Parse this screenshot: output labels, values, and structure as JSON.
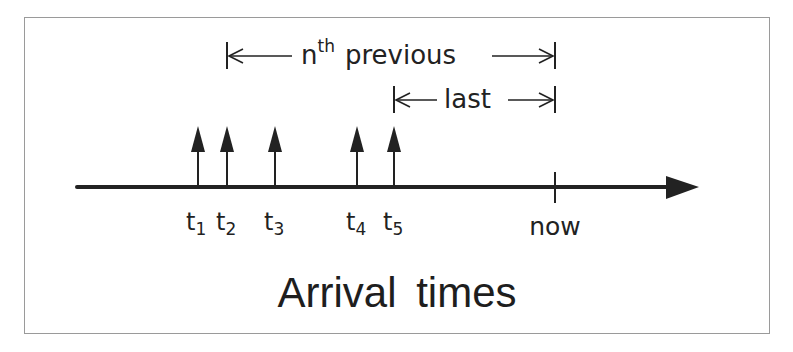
{
  "diagram": {
    "title": "Arrival times",
    "axis": {
      "start_x": 77,
      "end_x": 699,
      "y": 187,
      "now_label": "now",
      "now_x": 555
    },
    "arrivals": [
      {
        "label": "t",
        "sub": "1",
        "x": 198
      },
      {
        "label": "t",
        "sub": "2",
        "x": 227
      },
      {
        "label": "t",
        "sub": "3",
        "x": 275
      },
      {
        "label": "t",
        "sub": "4",
        "x": 357
      },
      {
        "label": "t",
        "sub": "5",
        "x": 394
      }
    ],
    "intervals": [
      {
        "name": "nth-previous",
        "base": "n",
        "sup": "th",
        "text": "previous",
        "from_x": 227,
        "to_x": 555,
        "y": 56
      },
      {
        "name": "last",
        "text": "last",
        "from_x": 394,
        "to_x": 555,
        "y": 100
      }
    ],
    "colors": {
      "ink": "#222222",
      "frame": "#9a9a9a",
      "background": "#ffffff"
    }
  }
}
